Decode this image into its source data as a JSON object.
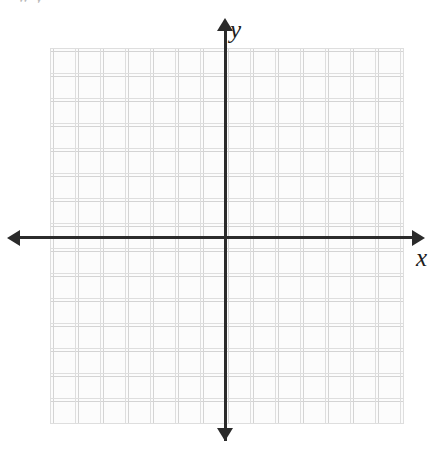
{
  "figure": {
    "kind": "blank-cartesian-coordinate-grid",
    "width": 439,
    "height": 449,
    "background_color": "#ffffff",
    "cropped_header_text": "w y"
  },
  "axes": {
    "x": {
      "label": "x",
      "color": "#2b2b2b",
      "arrow_left": "◀",
      "arrow_right": "▶"
    },
    "y": {
      "label": "y",
      "color": "#2b2b2b",
      "arrow_up": "▲",
      "arrow_down": "▼"
    },
    "origin_label": ""
  },
  "grid": {
    "line_color": "#d4d4d4",
    "cell_size_px": 25,
    "columns": 14,
    "rows": 15,
    "fill_color": "#fcfcfc",
    "tick_labels": []
  },
  "chart_data": {
    "type": "scatter",
    "title": "",
    "xlabel": "x",
    "ylabel": "y",
    "xlim": [
      -7,
      7
    ],
    "ylim": [
      -7.5,
      7.5
    ],
    "xticks": [
      -7,
      -6,
      -5,
      -4,
      -3,
      -2,
      -1,
      0,
      1,
      2,
      3,
      4,
      5,
      6,
      7
    ],
    "yticks": [
      -7,
      -6,
      -5,
      -4,
      -3,
      -2,
      -1,
      0,
      1,
      2,
      3,
      4,
      5,
      6,
      7
    ],
    "tick_labels_shown": false,
    "grid": true,
    "legend": null,
    "series": [
      {
        "name": "",
        "x": [],
        "y": []
      }
    ],
    "annotations": []
  }
}
